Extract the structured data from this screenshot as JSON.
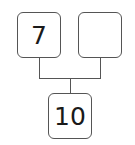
{
  "diagram": {
    "type": "number-bond",
    "parts": [
      {
        "label": "7"
      },
      {
        "label": ""
      }
    ],
    "whole": {
      "label": "10"
    },
    "colors": {
      "stroke": "#555555",
      "text": "#1a1a1a",
      "background": "#ffffff"
    }
  }
}
